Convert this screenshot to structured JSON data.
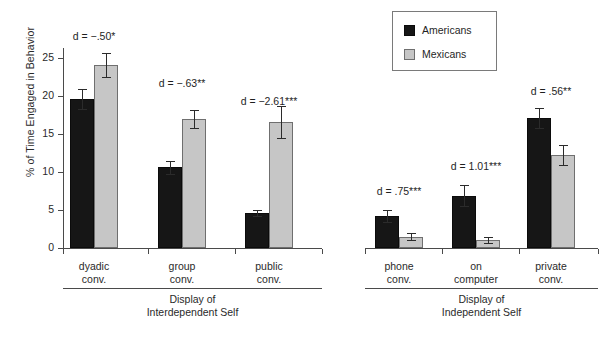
{
  "chart_data": {
    "type": "bar",
    "title": "",
    "xlabel": "",
    "ylabel": "% of Time Engaged in Behavior",
    "ylim": [
      0,
      26
    ],
    "yticks": [
      0,
      5,
      10,
      15,
      20,
      25
    ],
    "ytick_labels": [
      "0",
      "5",
      "10",
      "15",
      "20",
      "25"
    ],
    "grid": false,
    "legend_position": "top-right",
    "categories": [
      "dyadic conv.",
      "group conv.",
      "public conv.",
      "phone conv.",
      "on computer",
      "private conv."
    ],
    "series": [
      {
        "name": "Americans",
        "color": "#161616",
        "values": [
          19.6,
          10.6,
          4.6,
          4.2,
          6.9,
          17.1
        ],
        "errors": [
          1.3,
          0.9,
          0.45,
          0.75,
          1.4,
          1.3
        ]
      },
      {
        "name": "Mexicans",
        "color": "#c6c6c6",
        "values": [
          24.1,
          17.0,
          16.6,
          1.5,
          1.0,
          12.2
        ],
        "errors": [
          1.6,
          1.2,
          2.1,
          0.45,
          0.4,
          1.3
        ]
      }
    ],
    "annotations": [
      {
        "text": "d = −.50*",
        "category": "dyadic conv."
      },
      {
        "text": "d = −.63**",
        "category": "group conv."
      },
      {
        "text": "d = −2.61***",
        "category": "public conv."
      },
      {
        "text": "d = .75***",
        "category": "phone conv."
      },
      {
        "text": "d = 1.01***",
        "category": "on computer"
      },
      {
        "text": "d = .56**",
        "category": "private conv."
      }
    ],
    "panels": [
      {
        "label_line1": "Display of",
        "label_line2": "Interdependent Self",
        "categories": [
          "dyadic conv.",
          "group conv.",
          "public conv."
        ]
      },
      {
        "label_line1": "Display of",
        "label_line2": "Independent Self",
        "categories": [
          "phone conv.",
          "on computer",
          "private conv."
        ]
      }
    ]
  },
  "axis": {
    "ylabel": "% of Time Engaged in Behavior",
    "ytick_0": "0",
    "ytick_5": "5",
    "ytick_10": "10",
    "ytick_15": "15",
    "ytick_20": "20",
    "ytick_25": "25"
  },
  "legend": {
    "items": [
      {
        "label": "Americans",
        "color": "#161616"
      },
      {
        "label": "Mexicans",
        "color": "#c6c6c6"
      }
    ]
  },
  "categories": [
    {
      "line1": "dyadic",
      "line2": "conv."
    },
    {
      "line1": "group",
      "line2": "conv."
    },
    {
      "line1": "public",
      "line2": "conv."
    },
    {
      "line1": "phone",
      "line2": "conv."
    },
    {
      "line1": "on",
      "line2": "computer"
    },
    {
      "line1": "private",
      "line2": "conv."
    }
  ],
  "annotations": [
    {
      "text": "d = −.50*"
    },
    {
      "text": "d = −.63**"
    },
    {
      "text": "d = −2.61***"
    },
    {
      "text": "d = .75***"
    },
    {
      "text": "d = 1.01***"
    },
    {
      "text": "d = .56**"
    }
  ],
  "panels": [
    {
      "line1": "Display of",
      "line2": "Interdependent Self"
    },
    {
      "line1": "Display of",
      "line2": "Independent Self"
    }
  ]
}
